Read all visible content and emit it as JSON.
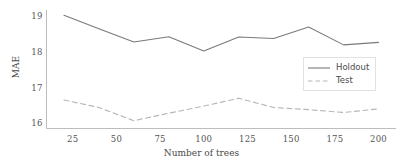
{
  "chart_data": {
    "type": "line",
    "title": "",
    "xlabel": "Number of trees",
    "ylabel": "MAE",
    "xlim": [
      10,
      210
    ],
    "ylim": [
      15.85,
      19.18
    ],
    "xticks": [
      25,
      50,
      75,
      100,
      125,
      150,
      175,
      200
    ],
    "yticks": [
      16,
      17,
      18,
      19
    ],
    "xtick_labels": [
      "25",
      "50",
      "75",
      "100",
      "125",
      "150",
      "175",
      "200"
    ],
    "ytick_labels": [
      "16",
      "17",
      "18",
      "19"
    ],
    "grid": false,
    "legend_position": "center-right",
    "x": [
      20,
      40,
      60,
      80,
      100,
      120,
      140,
      160,
      180,
      200
    ],
    "series": [
      {
        "name": "Holdout",
        "style": "solid",
        "color": "#7a7a7a",
        "values": [
          19.03,
          18.65,
          18.28,
          18.43,
          18.03,
          18.42,
          18.38,
          18.7,
          18.2,
          18.27
        ]
      },
      {
        "name": "Test",
        "style": "dashed",
        "color": "#b6b6b6",
        "values": [
          16.65,
          16.44,
          16.07,
          16.28,
          16.48,
          16.7,
          16.44,
          16.38,
          16.3,
          16.4
        ]
      }
    ]
  },
  "legend": {
    "entries": [
      {
        "label": "Holdout",
        "style": "solid"
      },
      {
        "label": "Test",
        "style": "dashed"
      }
    ]
  },
  "colors": {
    "holdout_line": "#7a7a7a",
    "test_line": "#b6b6b6",
    "axis": "#bdbdbd",
    "tick_text": "#555555",
    "background": "#ffffff"
  }
}
